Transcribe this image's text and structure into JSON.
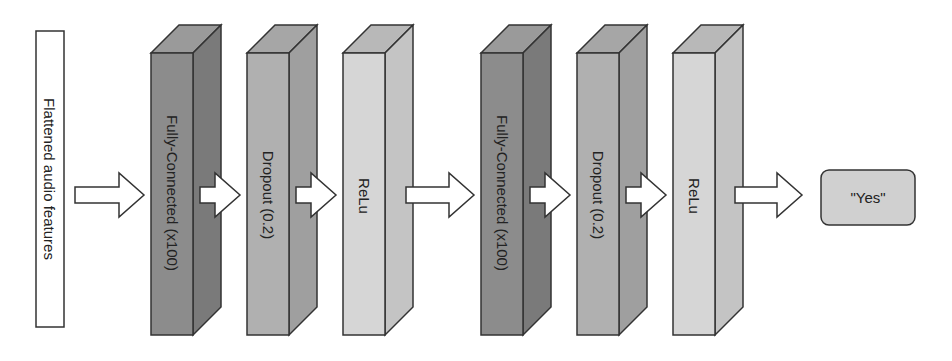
{
  "diagram": {
    "input": {
      "label": "Flattened audio features"
    },
    "layers": [
      {
        "label": "Fully-Connected (x100)",
        "type": "fully-connected",
        "front": "#8c8c8c",
        "side": "#7a7a7a",
        "top": "#9a9a9a"
      },
      {
        "label": "Dropout (0.2)",
        "type": "dropout",
        "front": "#b0b0b0",
        "side": "#9f9f9f",
        "top": "#a6a6a6"
      },
      {
        "label": "ReLu",
        "type": "relu",
        "front": "#d6d6d6",
        "side": "#c4c4c4",
        "top": "#b8b8b8"
      },
      {
        "label": "Fully-Connected (x100)",
        "type": "fully-connected",
        "front": "#8c8c8c",
        "side": "#7a7a7a",
        "top": "#9a9a9a"
      },
      {
        "label": "Dropout (0.2)",
        "type": "dropout",
        "front": "#b0b0b0",
        "side": "#9f9f9f",
        "top": "#a6a6a6"
      },
      {
        "label": "ReLu",
        "type": "relu",
        "front": "#d6d6d6",
        "side": "#c4c4c4",
        "top": "#b8b8b8"
      }
    ],
    "output": {
      "label": "\"Yes\"",
      "fill": "#d0d0d0"
    },
    "colors": {
      "stroke": "#333333",
      "arrow_fill": "#ffffff",
      "background": "#ffffff"
    }
  }
}
